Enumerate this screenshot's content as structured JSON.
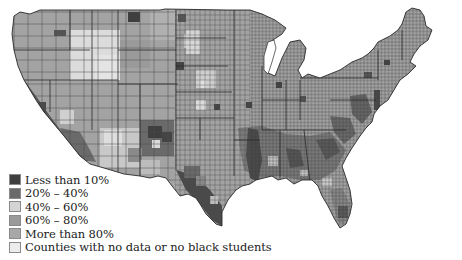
{
  "map": {
    "subject": "US counties shaded by percentage category for black students",
    "colors": {
      "background": "#ffffff",
      "border": "#3a3a3a",
      "lt10": "#3f3f3f",
      "p20_40": "#6a6a6a",
      "p40_60": "#d4d4d4",
      "p60_80": "#9a9a9a",
      "gt80": "#a8a8a8",
      "nodata": "#ececec"
    }
  },
  "legend": {
    "items": [
      {
        "label": "Less than 10%",
        "color": "#3f3f3f"
      },
      {
        "label": "20% – 40%",
        "color": "#6a6a6a"
      },
      {
        "label": "40% – 60%",
        "color": "#d4d4d4"
      },
      {
        "label": "60% – 80%",
        "color": "#9a9a9a"
      },
      {
        "label": "More than 80%",
        "color": "#a8a8a8"
      },
      {
        "label": "Counties with no data or no black students",
        "color": "#ececec"
      }
    ]
  }
}
